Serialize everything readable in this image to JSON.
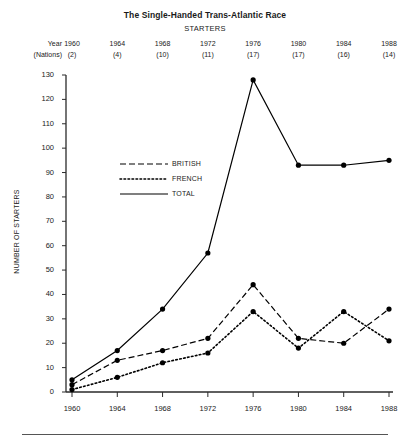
{
  "chart_data": {
    "type": "line",
    "title": "The Single-Handed Trans-Atlantic Race",
    "subtitle": "STARTERS",
    "xlabel": "",
    "ylabel": "NUMBER OF STARTERS",
    "x": [
      1960,
      1964,
      1968,
      1972,
      1976,
      1980,
      1984,
      1988
    ],
    "xtick_labels": [
      "1960",
      "1964",
      "1968",
      "1972",
      "1976",
      "1980",
      "1984",
      "1988"
    ],
    "xlim": [
      1958,
      1990
    ],
    "ylim": [
      0,
      130
    ],
    "ytick_labels": [
      "0",
      "10",
      "20",
      "30",
      "40",
      "50",
      "60",
      "70",
      "80",
      "90",
      "100",
      "110",
      "120",
      "130"
    ],
    "ytick_values": [
      0,
      10,
      20,
      30,
      40,
      50,
      60,
      70,
      80,
      90,
      100,
      110,
      120,
      130
    ],
    "grid": false,
    "legend_position": "upper-left-inside",
    "header_table": {
      "row_labels": [
        "Year",
        "(Nations)"
      ],
      "years": [
        "1960",
        "1964",
        "1968",
        "1972",
        "1976",
        "1980",
        "1984",
        "1988"
      ],
      "nations": [
        "(2)",
        "(4)",
        "(10)",
        "(11)",
        "(17)",
        "(17)",
        "(16)",
        "(14)"
      ]
    },
    "series": [
      {
        "name": "BRITISH",
        "style": "dashed",
        "color": "#000000",
        "values": [
          3,
          13,
          17,
          22,
          44,
          22,
          20,
          34
        ]
      },
      {
        "name": "FRENCH",
        "style": "dotted",
        "color": "#000000",
        "values": [
          1,
          6,
          12,
          16,
          33,
          18,
          33,
          21
        ]
      },
      {
        "name": "TOTAL",
        "style": "solid",
        "color": "#000000",
        "values": [
          5,
          17,
          34,
          57,
          128,
          93,
          93,
          95
        ]
      }
    ]
  }
}
